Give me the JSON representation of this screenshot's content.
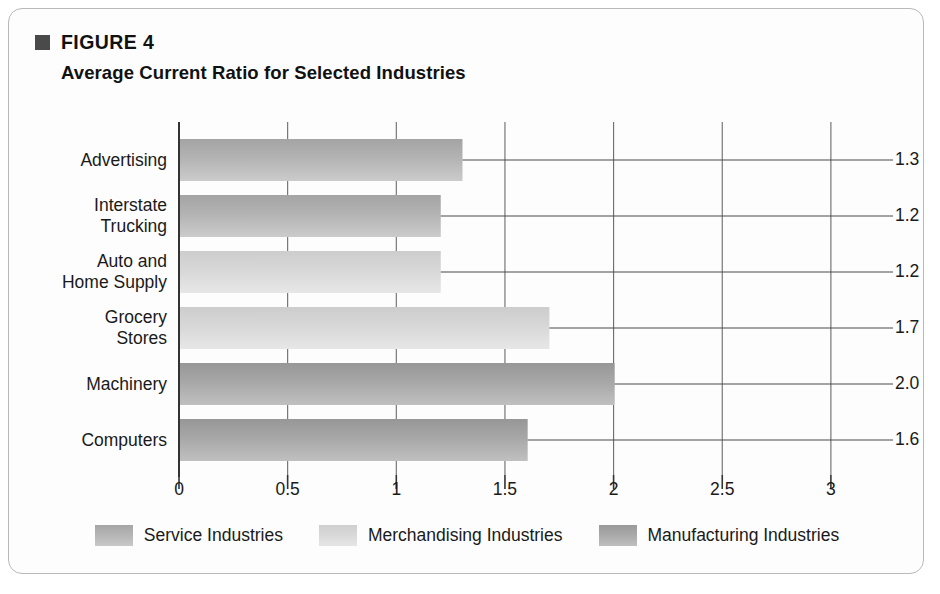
{
  "figure": {
    "bullet_icon": "filled-square-icon",
    "label": "FIGURE 4",
    "title": "Average Current Ratio for Selected Industries"
  },
  "chart_data": {
    "type": "bar",
    "orientation": "horizontal",
    "title": "Average Current Ratio for Selected Industries",
    "xlabel": "",
    "ylabel": "",
    "xlim": [
      0,
      3
    ],
    "xticks": [
      "0",
      "0.5",
      "1",
      "1.5",
      "2",
      "2.5",
      "3"
    ],
    "xtick_values": [
      0,
      0.5,
      1,
      1.5,
      2,
      2.5,
      3
    ],
    "grid": "vertical",
    "legend_position": "bottom",
    "categories": [
      "Advertising",
      "Interstate Trucking",
      "Auto and Home Supply",
      "Grocery Stores",
      "Machinery",
      "Computers"
    ],
    "values": [
      1.3,
      1.2,
      1.2,
      1.7,
      2.0,
      1.6
    ],
    "value_labels": [
      "1.3",
      "1.2",
      "1.2",
      "1.7",
      "2.0",
      "1.6"
    ],
    "groups": [
      "Service Industries",
      "Service Industries",
      "Merchandising Industries",
      "Merchandising Industries",
      "Manufacturing Industries",
      "Manufacturing Industries"
    ],
    "bars": [
      {
        "label_lines": [
          "Advertising"
        ],
        "value": 1.3,
        "value_label": "1.3",
        "group": "service"
      },
      {
        "label_lines": [
          "Interstate",
          "Trucking"
        ],
        "value": 1.2,
        "value_label": "1.2",
        "group": "service"
      },
      {
        "label_lines": [
          "Auto and",
          "Home Supply"
        ],
        "value": 1.2,
        "value_label": "1.2",
        "group": "merchandising"
      },
      {
        "label_lines": [
          "Grocery",
          "Stores"
        ],
        "value": 1.7,
        "value_label": "1.7",
        "group": "merchandising"
      },
      {
        "label_lines": [
          "Machinery"
        ],
        "value": 2.0,
        "value_label": "2.0",
        "group": "manufacturing"
      },
      {
        "label_lines": [
          "Computers"
        ],
        "value": 1.6,
        "value_label": "1.6",
        "group": "manufacturing"
      }
    ],
    "legend": [
      {
        "key": "service",
        "label": "Service Industries",
        "color": "#b4b4b4"
      },
      {
        "key": "merchandising",
        "label": "Merchandising Industries",
        "color": "#d8d8d8"
      },
      {
        "key": "manufacturing",
        "label": "Manufacturing Industries",
        "color": "#a8a8a8"
      }
    ]
  },
  "colors": {
    "frame_border": "#b9b9b9",
    "axis": "#333333",
    "gridline": "#6b6b6b",
    "leader_line": "#4a4a4a",
    "text": "#1a1a1a",
    "bullet": "#4a4a4a"
  }
}
